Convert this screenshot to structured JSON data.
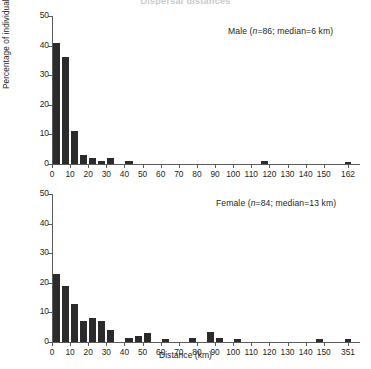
{
  "figure": {
    "title_remnant": "Dispersal distances",
    "xlabel": "Distance (km)",
    "ylabel": "Percentage of individuals",
    "bar_color": "#2b2b2b",
    "axis_color": "#5a5a5a"
  },
  "chart_data": [
    {
      "type": "bar",
      "title": "Male (n=86; median=6 km)",
      "legend_prefix": "Male (",
      "legend_italic": "n",
      "legend_suffix": "=86; median=6 km)",
      "xlabel": "",
      "ylabel": "Percentage of individuals",
      "ylim": [
        0,
        50
      ],
      "yticks": [
        0,
        10,
        20,
        30,
        40,
        50
      ],
      "ytick_labels": [
        "0",
        "10",
        "20",
        "30",
        "40",
        "50"
      ],
      "xticks": [
        0,
        10,
        20,
        30,
        40,
        50,
        60,
        70,
        80,
        90,
        100,
        110,
        120,
        130,
        140,
        150,
        162
      ],
      "xtick_labels": [
        "0",
        "10",
        "20",
        "30",
        "40",
        "50",
        "60",
        "70",
        "80",
        "90",
        "100",
        "110",
        "120",
        "130",
        "140",
        "150",
        "162"
      ],
      "xlim": [
        0,
        170
      ],
      "grid": false,
      "n": 86,
      "median_km": 6,
      "bin_width": 5,
      "bins": [
        {
          "x0": 0,
          "x1": 5,
          "value": 41
        },
        {
          "x0": 5,
          "x1": 10,
          "value": 36
        },
        {
          "x0": 10,
          "x1": 15,
          "value": 11
        },
        {
          "x0": 15,
          "x1": 20,
          "value": 3
        },
        {
          "x0": 20,
          "x1": 25,
          "value": 2
        },
        {
          "x0": 25,
          "x1": 30,
          "value": 1
        },
        {
          "x0": 30,
          "x1": 35,
          "value": 2
        },
        {
          "x0": 40,
          "x1": 45,
          "value": 1
        },
        {
          "x0": 115,
          "x1": 120,
          "value": 1
        },
        {
          "x0": 160,
          "x1": 165,
          "value": 0.8
        }
      ]
    },
    {
      "type": "bar",
      "title": "Female (n=84; median=13 km)",
      "legend_prefix": "Female (",
      "legend_italic": "n",
      "legend_suffix": "=84; median=13 km)",
      "xlabel": "Distance (km)",
      "ylabel": "Percentage of individuals",
      "ylim": [
        0,
        50
      ],
      "yticks": [
        0,
        10,
        20,
        30,
        40,
        50
      ],
      "ytick_labels": [
        "0",
        "10",
        "20",
        "30",
        "40",
        "50"
      ],
      "xticks": [
        0,
        10,
        20,
        30,
        40,
        50,
        60,
        70,
        80,
        90,
        100,
        110,
        120,
        130,
        140,
        150,
        351
      ],
      "xtick_labels": [
        "0",
        "10",
        "20",
        "30",
        "40",
        "50",
        "60",
        "70",
        "80",
        "90",
        "100",
        "110",
        "120",
        "130",
        "140",
        "150",
        "351"
      ],
      "xlim": [
        0,
        170
      ],
      "grid": false,
      "n": 84,
      "median_km": 13,
      "bin_width": 5,
      "bins": [
        {
          "x0": 0,
          "x1": 5,
          "value": 23
        },
        {
          "x0": 5,
          "x1": 10,
          "value": 19
        },
        {
          "x0": 10,
          "x1": 15,
          "value": 13
        },
        {
          "x0": 15,
          "x1": 20,
          "value": 7
        },
        {
          "x0": 20,
          "x1": 25,
          "value": 8
        },
        {
          "x0": 25,
          "x1": 30,
          "value": 7
        },
        {
          "x0": 30,
          "x1": 35,
          "value": 4
        },
        {
          "x0": 40,
          "x1": 45,
          "value": 1.5
        },
        {
          "x0": 45,
          "x1": 50,
          "value": 2
        },
        {
          "x0": 50,
          "x1": 55,
          "value": 3
        },
        {
          "x0": 60,
          "x1": 65,
          "value": 1
        },
        {
          "x0": 75,
          "x1": 80,
          "value": 1.5
        },
        {
          "x0": 85,
          "x1": 90,
          "value": 3.5
        },
        {
          "x0": 90,
          "x1": 95,
          "value": 1.5
        },
        {
          "x0": 100,
          "x1": 105,
          "value": 1
        },
        {
          "x0": 145,
          "x1": 150,
          "value": 1
        },
        {
          "x0": 160,
          "x1": 165,
          "value": 1
        }
      ]
    }
  ]
}
